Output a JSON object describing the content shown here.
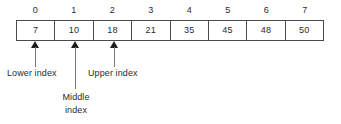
{
  "figure": {
    "colors": {
      "border": "#4a4a4a",
      "text": "#2b2b2b",
      "arrow_head": "#1c1c1c",
      "arrow_stem": "#7a7a7a",
      "background": "#ffffff"
    }
  },
  "array": {
    "indices": [
      "0",
      "1",
      "2",
      "3",
      "4",
      "5",
      "6",
      "7"
    ],
    "values": [
      "7",
      "10",
      "18",
      "21",
      "35",
      "45",
      "48",
      "50"
    ]
  },
  "pointers": [
    {
      "id": "lower",
      "label_line1": "Lower index",
      "label_line2": "",
      "target_index": "0"
    },
    {
      "id": "middle",
      "label_line1": "Middle",
      "label_line2": "index",
      "target_index": "1"
    },
    {
      "id": "upper",
      "label_line1": "Upper index",
      "label_line2": "",
      "target_index": "2"
    }
  ]
}
